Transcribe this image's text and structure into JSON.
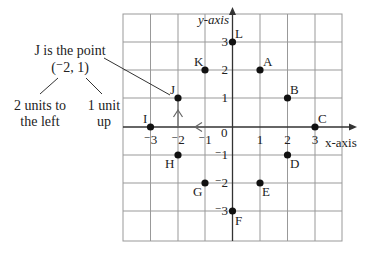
{
  "annotation": {
    "line1": "J is the point",
    "line2": "(⁻2, 1)",
    "left_note_1": "2 units to",
    "left_note_2": "the left",
    "right_note_1": "1 unit",
    "right_note_2": "up"
  },
  "axes": {
    "x_label": "x-axis",
    "y_label": "y-axis",
    "origin_label": "0",
    "x_ticks": [
      {
        "value": -3,
        "label": "⁻3"
      },
      {
        "value": -2,
        "label": "⁻2"
      },
      {
        "value": -1,
        "label": "⁻1"
      },
      {
        "value": 1,
        "label": "1"
      },
      {
        "value": 2,
        "label": "2"
      },
      {
        "value": 3,
        "label": "3"
      }
    ],
    "y_ticks": [
      {
        "value": 3,
        "label": "3"
      },
      {
        "value": 2,
        "label": "2"
      },
      {
        "value": 1,
        "label": "1"
      },
      {
        "value": -1,
        "label": "⁻1"
      },
      {
        "value": -2,
        "label": "⁻2"
      },
      {
        "value": -3,
        "label": "⁻3"
      }
    ],
    "grid_range": {
      "x": [
        -4,
        4
      ],
      "y": [
        -4,
        4
      ]
    }
  },
  "points": [
    {
      "name": "A",
      "x": 1,
      "y": 2
    },
    {
      "name": "B",
      "x": 2,
      "y": 1
    },
    {
      "name": "C",
      "x": 3,
      "y": 0
    },
    {
      "name": "D",
      "x": 2,
      "y": -1
    },
    {
      "name": "E",
      "x": 1,
      "y": -2
    },
    {
      "name": "F",
      "x": 0,
      "y": -3
    },
    {
      "name": "G",
      "x": -1,
      "y": -2
    },
    {
      "name": "H",
      "x": -2,
      "y": -1
    },
    {
      "name": "I",
      "x": -3,
      "y": 0
    },
    {
      "name": "J",
      "x": -2,
      "y": 1
    },
    {
      "name": "K",
      "x": -1,
      "y": 2
    },
    {
      "name": "L",
      "x": 0,
      "y": 3
    }
  ]
}
